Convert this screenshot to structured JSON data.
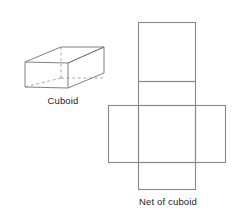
{
  "figure": {
    "background_color": "#ffffff",
    "line_color": "#808080",
    "hidden_line_color": "#a8a8a8",
    "text_color": "#1d1d1d"
  },
  "cuboid": {
    "caption": "Cuboid",
    "visible_edges": 9,
    "hidden_edges": 3,
    "description": "Oblique projection of a rectangular cuboid with dashed hidden edges"
  },
  "net": {
    "caption": "Net of cuboid",
    "face_count": 6,
    "arrangement": "cross",
    "faces": [
      {
        "name": "top-face",
        "label": ""
      },
      {
        "name": "upper-middle-face",
        "label": ""
      },
      {
        "name": "left-face",
        "label": ""
      },
      {
        "name": "center-face",
        "label": ""
      },
      {
        "name": "right-face",
        "label": ""
      },
      {
        "name": "bottom-face",
        "label": ""
      }
    ]
  }
}
